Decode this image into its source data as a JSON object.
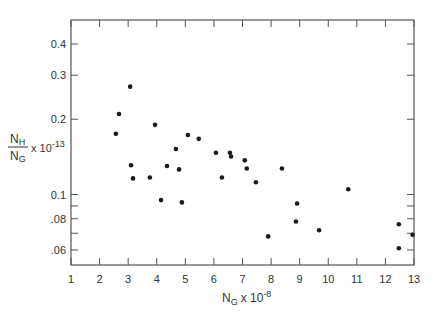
{
  "chart_data": {
    "type": "scatter",
    "title": "",
    "xlabel": "N_G x 10^-8",
    "ylabel": "N_H / N_G x 10^-13",
    "xlabel_parts": {
      "main": "N",
      "sub": "G",
      "mult": "x 10",
      "exp": "-8"
    },
    "ylabel_parts": {
      "num_main": "N",
      "num_sub": "H",
      "den_main": "N",
      "den_sub": "G",
      "mult": "x 10",
      "exp": "-13"
    },
    "xlim": [
      1,
      13
    ],
    "ylim": [
      0.055,
      0.47
    ],
    "yscale": "log",
    "grid": false,
    "legend": null,
    "x_ticks": [
      1,
      2,
      3,
      4,
      5,
      6,
      7,
      8,
      9,
      10,
      11,
      12,
      13
    ],
    "x_tick_labels": [
      "1",
      "2",
      "3",
      "4",
      "5",
      "6",
      "7",
      "8",
      "9",
      "10",
      "11",
      "12",
      "13"
    ],
    "y_ticks": [
      0.4,
      0.3,
      0.2,
      0.1,
      0.09,
      0.08,
      0.07,
      0.06
    ],
    "y_tick_labels": [
      "0.4",
      "0.3",
      "0.2",
      "0.1",
      "",
      ".08",
      "",
      ".06"
    ],
    "points": [
      {
        "x": 2.57,
        "y": 0.175
      },
      {
        "x": 2.68,
        "y": 0.21
      },
      {
        "x": 3.07,
        "y": 0.27
      },
      {
        "x": 3.1,
        "y": 0.131
      },
      {
        "x": 3.17,
        "y": 0.116
      },
      {
        "x": 3.76,
        "y": 0.117
      },
      {
        "x": 3.94,
        "y": 0.19
      },
      {
        "x": 4.15,
        "y": 0.095
      },
      {
        "x": 4.36,
        "y": 0.13
      },
      {
        "x": 4.67,
        "y": 0.152
      },
      {
        "x": 4.78,
        "y": 0.126
      },
      {
        "x": 4.88,
        "y": 0.093
      },
      {
        "x": 5.09,
        "y": 0.173
      },
      {
        "x": 5.47,
        "y": 0.167
      },
      {
        "x": 6.07,
        "y": 0.147
      },
      {
        "x": 6.28,
        "y": 0.117
      },
      {
        "x": 6.56,
        "y": 0.147
      },
      {
        "x": 6.6,
        "y": 0.142
      },
      {
        "x": 7.08,
        "y": 0.137
      },
      {
        "x": 7.15,
        "y": 0.127
      },
      {
        "x": 7.47,
        "y": 0.112
      },
      {
        "x": 7.9,
        "y": 0.068
      },
      {
        "x": 8.38,
        "y": 0.127
      },
      {
        "x": 8.87,
        "y": 0.078
      },
      {
        "x": 8.91,
        "y": 0.092
      },
      {
        "x": 9.68,
        "y": 0.072
      },
      {
        "x": 10.7,
        "y": 0.105
      },
      {
        "x": 12.47,
        "y": 0.076
      },
      {
        "x": 12.47,
        "y": 0.061
      },
      {
        "x": 12.95,
        "y": 0.069
      }
    ],
    "colors": {
      "axis": "#555555",
      "point": "#1a1a1a",
      "text": "#333333"
    }
  }
}
